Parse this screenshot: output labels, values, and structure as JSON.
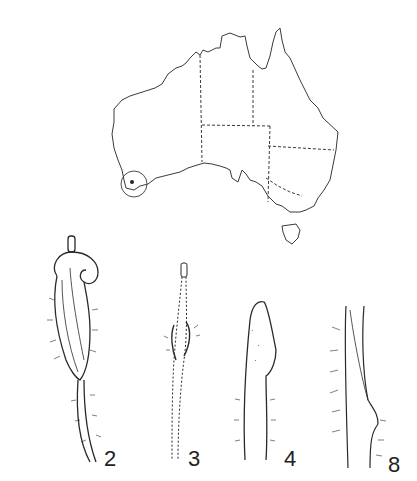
{
  "figure": {
    "map": {
      "region": "Australia",
      "marker": "circled-locality-southwest-WA"
    },
    "panels": [
      {
        "id": "2",
        "label": "2"
      },
      {
        "id": "3",
        "label": "3"
      },
      {
        "id": "4",
        "label": "4"
      },
      {
        "id": "8",
        "label": "8"
      }
    ],
    "colors": {
      "ink": "#2a2a2a",
      "paper": "#ffffff"
    }
  }
}
